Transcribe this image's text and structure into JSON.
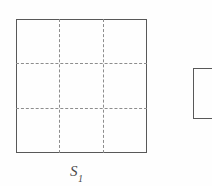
{
  "figure": {
    "background_color": "#fefefe",
    "stroke_color": "#585858",
    "dash_color": "#8d8d8d",
    "label_color": "#4a4a4a",
    "shapes": [
      {
        "name": "square-s1",
        "kind": "square",
        "label_base": "S",
        "label_subscript": "1",
        "x": 16,
        "y": 19,
        "width": 131,
        "height": 134,
        "border_style": "solid",
        "subdivision": "3x3",
        "interior_line_style": "dashed",
        "vertical_dividers": [
          59,
          103
        ],
        "horizontal_dividers": [
          63,
          108
        ]
      },
      {
        "name": "square-partial",
        "kind": "square",
        "label_base": "",
        "label_subscript": "",
        "x": 193,
        "y": 68,
        "width": 30,
        "height": 51,
        "border_style": "solid",
        "subdivision": "none",
        "interior_line_style": "none",
        "clipped": "right-edge"
      }
    ]
  }
}
